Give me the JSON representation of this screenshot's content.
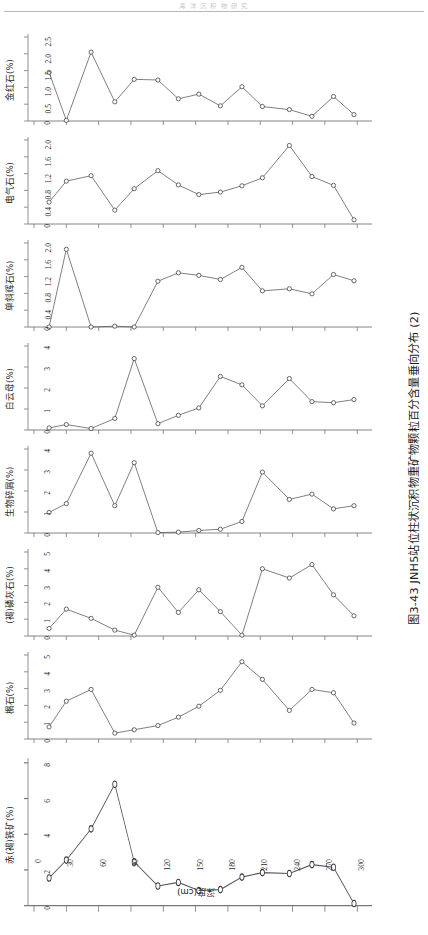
{
  "running_head": "海 洋 沉 积 物 研 究",
  "figure_caption": "图3-43  JNH5站位柱状沉积物重矿物颗粒百分含量垂向分布 (2)",
  "axis": {
    "x_title": "深度(cm)",
    "x_ticks": [
      0,
      30,
      60,
      90,
      120,
      150,
      180,
      210,
      240,
      270,
      300
    ],
    "x_min": 0,
    "x_max": 310
  },
  "chart_data": [
    {
      "type": "line",
      "title": "金红石(%)",
      "ylabel": "金红石(%)",
      "xlabel": "深度(cm)",
      "ylim": [
        0,
        2.5
      ],
      "yticks": [
        0,
        0.5,
        1.0,
        1.5,
        2.0,
        2.5
      ],
      "ytick_labels": [
        "0",
        "0.5",
        "1.0",
        "1.5",
        "2.0",
        "2.5"
      ],
      "x": [
        14,
        30,
        53,
        75,
        93,
        115,
        134,
        153,
        173,
        193,
        212,
        237,
        258,
        278,
        297
      ],
      "values": [
        1.45,
        0.02,
        2.05,
        0.57,
        1.24,
        1.22,
        0.66,
        0.8,
        0.45,
        1.02,
        0.43,
        0.34,
        0.14,
        0.73,
        0.19
      ],
      "grid": false,
      "marker": "open-circle"
    },
    {
      "type": "line",
      "title": "电气石(%)",
      "ylabel": "电气石(%)",
      "xlabel": "深度(cm)",
      "ylim": [
        0,
        2.0
      ],
      "yticks": [
        0,
        0.4,
        0.8,
        1.2,
        1.6,
        2.0
      ],
      "ytick_labels": [
        "0",
        "0.4",
        "0.8",
        "1.2",
        "1.6",
        "2.0"
      ],
      "x": [
        14,
        30,
        53,
        75,
        93,
        115,
        134,
        153,
        173,
        193,
        212,
        237,
        258,
        278,
        297
      ],
      "values": [
        0.52,
        1.02,
        1.15,
        0.33,
        0.84,
        1.27,
        0.93,
        0.7,
        0.76,
        0.91,
        1.1,
        1.87,
        1.13,
        0.92,
        0.1
      ],
      "grid": false,
      "marker": "open-circle"
    },
    {
      "type": "line",
      "title": "单斜辉石(%)",
      "ylabel": "单斜辉石(%)",
      "xlabel": "深度(cm)",
      "ylim": [
        0,
        2.0
      ],
      "yticks": [
        0,
        0.4,
        0.8,
        1.2,
        1.6,
        2.0
      ],
      "ytick_labels": [
        "0",
        "0.4",
        "0.8",
        "1.2",
        "1.6",
        "2.0"
      ],
      "x": [
        14,
        30,
        53,
        75,
        93,
        115,
        134,
        153,
        173,
        193,
        212,
        237,
        258,
        278,
        297
      ],
      "values": [
        0.0,
        1.85,
        0.0,
        0.02,
        0.0,
        1.09,
        1.29,
        1.23,
        1.13,
        1.42,
        0.86,
        0.91,
        0.79,
        1.25,
        1.1
      ],
      "grid": false,
      "marker": "open-circle"
    },
    {
      "type": "line",
      "title": "白云母(%)",
      "ylabel": "白云母(%)",
      "xlabel": "深度(cm)",
      "ylim": [
        0,
        4
      ],
      "yticks": [
        0,
        1,
        2,
        3,
        4
      ],
      "ytick_labels": [
        "0",
        "1",
        "2",
        "3",
        "4"
      ],
      "x": [
        14,
        30,
        53,
        75,
        93,
        115,
        134,
        153,
        173,
        193,
        212,
        237,
        258,
        278,
        297
      ],
      "values": [
        0.1,
        0.26,
        0.07,
        0.55,
        3.4,
        0.3,
        0.7,
        1.05,
        2.55,
        2.15,
        1.15,
        2.45,
        1.35,
        1.3,
        1.45
      ],
      "grid": false,
      "marker": "open-circle"
    },
    {
      "type": "line",
      "title": "生物碎屑(%)",
      "ylabel": "生物碎屑(%)",
      "xlabel": "深度(cm)",
      "ylim": [
        0,
        4
      ],
      "yticks": [
        0,
        1,
        2,
        3,
        4
      ],
      "ytick_labels": [
        "0",
        "1",
        "2",
        "3",
        "4"
      ],
      "x": [
        14,
        30,
        53,
        75,
        93,
        115,
        134,
        153,
        173,
        193,
        212,
        237,
        258,
        278,
        297
      ],
      "values": [
        0.98,
        1.4,
        3.8,
        1.3,
        3.35,
        0.02,
        0.04,
        0.12,
        0.18,
        0.55,
        2.9,
        1.6,
        1.85,
        1.15,
        1.3
      ],
      "grid": false,
      "marker": "open-circle"
    },
    {
      "type": "line",
      "title": "(褐)磷灰石(%)",
      "ylabel": "(褐)磷灰石(%)",
      "xlabel": "深度(cm)",
      "ylim": [
        0,
        5
      ],
      "yticks": [
        0,
        1,
        2,
        3,
        4,
        5
      ],
      "ytick_labels": [
        "0",
        "1",
        "2",
        "3",
        "4",
        "5"
      ],
      "x": [
        14,
        30,
        53,
        75,
        93,
        115,
        134,
        153,
        173,
        193,
        212,
        237,
        258,
        278,
        297
      ],
      "values": [
        0.45,
        1.6,
        1.05,
        0.35,
        0.05,
        2.9,
        1.4,
        2.75,
        1.45,
        0.05,
        4.0,
        3.45,
        4.25,
        2.45,
        1.2
      ],
      "grid": false,
      "marker": "open-circle"
    },
    {
      "type": "line",
      "title": "榍石(%)",
      "ylabel": "榍石(%)",
      "xlabel": "深度(cm)",
      "ylim": [
        0,
        5
      ],
      "yticks": [
        0,
        1,
        2,
        3,
        4,
        5
      ],
      "ytick_labels": [
        "0",
        "1",
        "2",
        "3",
        "4",
        "5"
      ],
      "x": [
        14,
        30,
        53,
        75,
        93,
        115,
        134,
        153,
        173,
        193,
        212,
        237,
        258,
        278,
        297
      ],
      "values": [
        0.72,
        2.25,
        2.95,
        0.35,
        0.55,
        0.8,
        1.3,
        1.95,
        2.9,
        4.6,
        3.55,
        1.7,
        2.95,
        2.75,
        0.95
      ],
      "grid": false,
      "marker": "open-circle"
    },
    {
      "type": "line",
      "title": "赤(褐)铁矿(%)",
      "ylabel": "赤(褐)铁矿(%)",
      "xlabel": "深度(cm)",
      "ylim": [
        0,
        8
      ],
      "yticks": [
        0,
        2,
        4,
        6,
        8
      ],
      "ytick_labels": [
        "0",
        "2",
        "4",
        "6",
        "8"
      ],
      "x": [
        14,
        30,
        53,
        75,
        93,
        115,
        134,
        153,
        173,
        193,
        212,
        237,
        258,
        278,
        297
      ],
      "values": [
        1.55,
        2.55,
        4.3,
        6.8,
        2.45,
        1.1,
        1.3,
        0.85,
        0.9,
        1.6,
        1.85,
        1.8,
        2.3,
        2.15,
        0.12
      ],
      "grid": false,
      "marker": "open-circle"
    }
  ],
  "colors": {
    "line": "#555555",
    "marker_stroke": "#3a3a3a",
    "marker_fill": "#ffffff",
    "axis": "#777777",
    "text": "#1f1f1f"
  }
}
